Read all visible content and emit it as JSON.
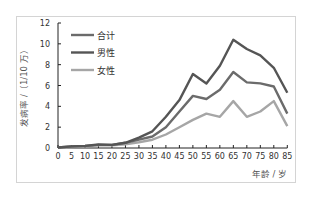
{
  "chart_data": {
    "type": "line",
    "title": "",
    "xlabel": "年龄 / 岁",
    "ylabel": "发病率 /（1/10 万）",
    "x": [
      0,
      5,
      10,
      15,
      20,
      25,
      30,
      35,
      40,
      45,
      50,
      55,
      60,
      65,
      70,
      75,
      80,
      85
    ],
    "xlim": [
      0,
      85
    ],
    "ylim": [
      0,
      12
    ],
    "yticks": [
      0,
      2,
      4,
      6,
      8,
      10,
      12
    ],
    "xticks": [
      0,
      5,
      10,
      15,
      20,
      25,
      30,
      35,
      40,
      45,
      50,
      55,
      60,
      65,
      70,
      75,
      80,
      85
    ],
    "grid": false,
    "legend_position": "upper-left",
    "series": [
      {
        "name": "合计",
        "color": "#6b6b6b",
        "values": [
          0.05,
          0.15,
          0.2,
          0.3,
          0.3,
          0.5,
          0.8,
          1.1,
          2.0,
          3.5,
          5.0,
          4.7,
          5.6,
          7.3,
          6.3,
          6.2,
          5.9,
          3.3
        ]
      },
      {
        "name": "男性",
        "color": "#555555",
        "values": [
          0.05,
          0.15,
          0.2,
          0.35,
          0.3,
          0.5,
          1.0,
          1.6,
          3.0,
          4.6,
          7.1,
          6.2,
          7.9,
          10.4,
          9.5,
          8.9,
          7.7,
          5.3
        ]
      },
      {
        "name": "女性",
        "color": "#a6a6a6",
        "values": [
          0.05,
          0.1,
          0.15,
          0.25,
          0.25,
          0.35,
          0.55,
          0.8,
          1.3,
          2.0,
          2.7,
          3.3,
          3.0,
          4.5,
          3.0,
          3.5,
          4.5,
          2.1
        ]
      }
    ]
  },
  "axis": {
    "y_title": "发病率 /（1/10 万）",
    "x_title": "年龄 / 岁",
    "y_ticks": [
      "0",
      "2",
      "4",
      "6",
      "8",
      "10",
      "12"
    ],
    "x_ticks": [
      "0",
      "5",
      "10",
      "15",
      "20",
      "25",
      "30",
      "35",
      "40",
      "45",
      "50",
      "55",
      "60",
      "65",
      "70",
      "75",
      "80",
      "85"
    ]
  },
  "legend": [
    {
      "label": "合计",
      "color": "#6b6b6b"
    },
    {
      "label": "男性",
      "color": "#555555"
    },
    {
      "label": "女性",
      "color": "#a6a6a6"
    }
  ]
}
